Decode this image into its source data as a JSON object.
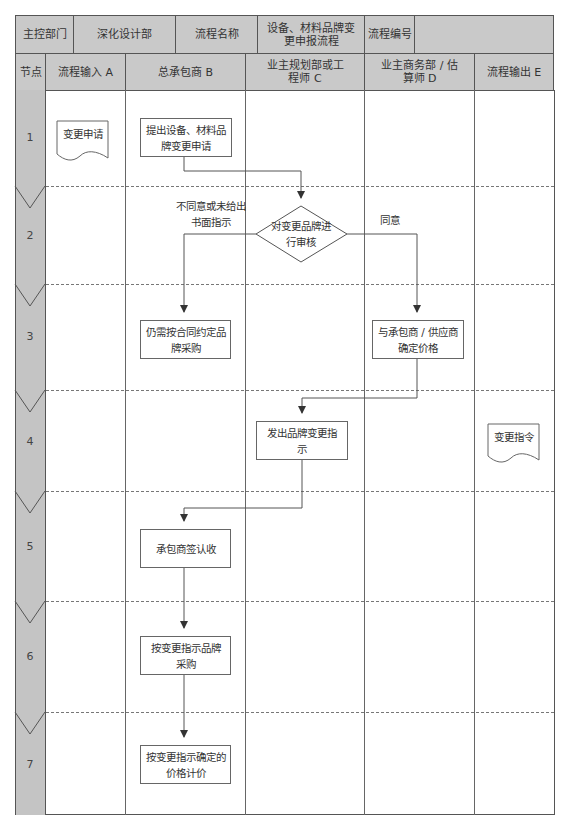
{
  "header": {
    "row1": {
      "main_dept_label": "主控部门",
      "main_dept_value": "深化设计部",
      "process_name_label": "流程名称",
      "process_name_value": "设备、材料品牌变更申报流程",
      "process_no_label": "流程编号",
      "process_no_value": ""
    },
    "row2": {
      "node": "节点",
      "lanes": [
        "流程输入 A",
        "总承包商 B",
        "业主规划部或工程师 C",
        "业主商务部 / 估算师 D",
        "流程输出 E"
      ]
    }
  },
  "nodes": [
    "1",
    "2",
    "3",
    "4",
    "5",
    "6",
    "7"
  ],
  "shapes": {
    "doc_input": "变更申请",
    "step1": "提出设备、材料品牌变更申请",
    "decision": "对变更品牌进行审核",
    "label_reject": "不同意或未给出书面指示",
    "label_agree": "同意",
    "step3_b": "仍需按合同约定品牌采购",
    "step3_d": "与承包商 / 供应商确定价格",
    "step4": "发出品牌变更指示",
    "doc_output": "变更指令",
    "step5": "承包商签认收",
    "step6": "按变更指示品牌采购",
    "step7": "按变更指示确定的价格计价"
  },
  "colors": {
    "header_bg": "#c9c9c9",
    "node_col_bg": "#c4c4c4",
    "border": "#555555",
    "line": "#555555"
  }
}
